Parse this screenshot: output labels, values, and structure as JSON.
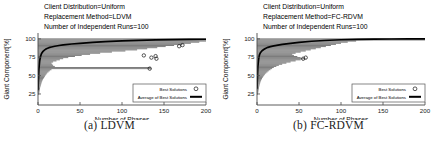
{
  "figure": {
    "panels": [
      {
        "caption": "(a) LDVM",
        "annotations": [
          "Client Distribution=Uniform",
          "Replacement Method=LDVM",
          "Number of Independent Runs=100"
        ],
        "legend": {
          "best_label": "Best Solutions",
          "avg_label": "Average of Best Solutions",
          "best_marker": "circle-marker",
          "avg_marker": "solid-line"
        },
        "chart_data": {
          "type": "scatter",
          "title": "",
          "xlabel": "Number of Phases",
          "ylabel": "Giant Component[%]",
          "xlim": [
            0,
            200
          ],
          "ylim": [
            10,
            108
          ],
          "xticks": [
            0,
            50,
            100,
            150,
            200
          ],
          "yticks": [
            25,
            50,
            75,
            100
          ],
          "grid": false,
          "series": [
            {
              "name": "Average of Best Solutions",
              "type": "line",
              "x": [
                0,
                1,
                2,
                3,
                4,
                5,
                6,
                8,
                10,
                13,
                16,
                20,
                25,
                30,
                40,
                50,
                65,
                80,
                100,
                120,
                140,
                160,
                180,
                200
              ],
              "y": [
                30,
                58,
                70,
                76,
                79.5,
                81.5,
                83,
                85,
                86.5,
                88,
                89,
                90,
                91,
                91.8,
                93,
                94,
                95.2,
                96.2,
                97.2,
                98,
                98.6,
                99,
                99.3,
                99.5
              ]
            },
            {
              "name": "Best Solutions spread",
              "type": "horizontal-bands",
              "comment": "each band = run max extent at a giant-component level; x_end is the phase where that level is reached",
              "bands": [
                {
                  "y": 25.0,
                  "x_start": 0.0,
                  "x_end": 1.4
                },
                {
                  "y": 26.5,
                  "x_start": 0.0,
                  "x_end": 1.6
                },
                {
                  "y": 28.0,
                  "x_start": 0.0,
                  "x_end": 1.8
                },
                {
                  "y": 29.5,
                  "x_start": 0.0,
                  "x_end": 2.0
                },
                {
                  "y": 31.0,
                  "x_start": 0.0,
                  "x_end": 2.2
                },
                {
                  "y": 32.5,
                  "x_start": 0.0,
                  "x_end": 2.4
                },
                {
                  "y": 34.0,
                  "x_start": 0.0,
                  "x_end": 2.6
                },
                {
                  "y": 35.5,
                  "x_start": 0.0,
                  "x_end": 3.0
                },
                {
                  "y": 37.0,
                  "x_start": 0.0,
                  "x_end": 3.4
                },
                {
                  "y": 38.5,
                  "x_start": 0.0,
                  "x_end": 3.8
                },
                {
                  "y": 40.0,
                  "x_start": 0.0,
                  "x_end": 4.2
                },
                {
                  "y": 41.5,
                  "x_start": 0.0,
                  "x_end": 4.6
                },
                {
                  "y": 43.0,
                  "x_start": 0.0,
                  "x_end": 5.2
                },
                {
                  "y": 44.5,
                  "x_start": 0.0,
                  "x_end": 5.8
                },
                {
                  "y": 46.0,
                  "x_start": 0.0,
                  "x_end": 6.6
                },
                {
                  "y": 47.5,
                  "x_start": 0.0,
                  "x_end": 7.4
                },
                {
                  "y": 49.0,
                  "x_start": 0.0,
                  "x_end": 8.2
                },
                {
                  "y": 50.5,
                  "x_start": 0.0,
                  "x_end": 9.0
                },
                {
                  "y": 52.0,
                  "x_start": 0.0,
                  "x_end": 10.0
                },
                {
                  "y": 53.5,
                  "x_start": 0.0,
                  "x_end": 11.0
                },
                {
                  "y": 55.0,
                  "x_start": 0.0,
                  "x_end": 12.5
                },
                {
                  "y": 56.5,
                  "x_start": 0.0,
                  "x_end": 14.0
                },
                {
                  "y": 58.0,
                  "x_start": 0.0,
                  "x_end": 16.0
                },
                {
                  "y": 59.5,
                  "x_start": 0.0,
                  "x_end": 135.0
                },
                {
                  "y": 61.0,
                  "x_start": 0.0,
                  "x_end": 134.0
                },
                {
                  "y": 62.5,
                  "x_start": 0.0,
                  "x_end": 20.0
                },
                {
                  "y": 64.0,
                  "x_start": 0.0,
                  "x_end": 18.0
                },
                {
                  "y": 65.5,
                  "x_start": 0.0,
                  "x_end": 17.0
                },
                {
                  "y": 67.0,
                  "x_start": 0.0,
                  "x_end": 16.0
                },
                {
                  "y": 68.5,
                  "x_start": 0.0,
                  "x_end": 18.0
                },
                {
                  "y": 70.0,
                  "x_start": 0.0,
                  "x_end": 22.0
                },
                {
                  "y": 71.5,
                  "x_start": 0.0,
                  "x_end": 26.0
                },
                {
                  "y": 73.0,
                  "x_start": 0.0,
                  "x_end": 30.0
                },
                {
                  "y": 74.5,
                  "x_start": 0.0,
                  "x_end": 36.0
                },
                {
                  "y": 76.0,
                  "x_start": 0.0,
                  "x_end": 44.0
                },
                {
                  "y": 77.5,
                  "x_start": 0.0,
                  "x_end": 52.0
                },
                {
                  "y": 79.0,
                  "x_start": 0.0,
                  "x_end": 62.0
                },
                {
                  "y": 80.5,
                  "x_start": 0.0,
                  "x_end": 74.0
                },
                {
                  "y": 82.0,
                  "x_start": 0.0,
                  "x_end": 88.0
                },
                {
                  "y": 83.5,
                  "x_start": 0.0,
                  "x_end": 104.0
                },
                {
                  "y": 85.0,
                  "x_start": 0.0,
                  "x_end": 118.0
                },
                {
                  "y": 86.5,
                  "x_start": 0.0,
                  "x_end": 130.0
                },
                {
                  "y": 88.0,
                  "x_start": 0.0,
                  "x_end": 142.0
                },
                {
                  "y": 89.5,
                  "x_start": 0.0,
                  "x_end": 152.0
                },
                {
                  "y": 91.0,
                  "x_start": 0.0,
                  "x_end": 162.0
                },
                {
                  "y": 92.5,
                  "x_start": 0.0,
                  "x_end": 172.0
                },
                {
                  "y": 94.0,
                  "x_start": 0.0,
                  "x_end": 182.0
                },
                {
                  "y": 95.5,
                  "x_start": 0.0,
                  "x_end": 192.0
                },
                {
                  "y": 97.0,
                  "x_start": 0.0,
                  "x_end": 200.0
                },
                {
                  "y": 98.5,
                  "x_start": 0.0,
                  "x_end": 200.0
                },
                {
                  "y": 100.0,
                  "x_start": 0.0,
                  "x_end": 200.0
                }
              ],
              "outliers": [
                {
                  "x": 126,
                  "y": 77.5
                },
                {
                  "x": 133,
                  "y": 59.5
                },
                {
                  "x": 135,
                  "y": 74.5
                },
                {
                  "x": 140,
                  "y": 76.5
                },
                {
                  "x": 141,
                  "y": 73.0
                },
                {
                  "x": 168,
                  "y": 90.0
                },
                {
                  "x": 172,
                  "y": 91.5
                }
              ]
            }
          ]
        }
      },
      {
        "caption": "(b) FC-RDVM",
        "annotations": [
          "Client Distribution=Uniform",
          "Replacement Method=FC-RDVM",
          "Number of Independent Runs=100"
        ],
        "legend": {
          "best_label": "Best Solutions",
          "avg_label": "Average of Best Solutions",
          "best_marker": "circle-marker",
          "avg_marker": "solid-line"
        },
        "chart_data": {
          "type": "scatter",
          "title": "",
          "xlabel": "Number of Phases",
          "ylabel": "Giant Component[%]",
          "xlim": [
            0,
            200
          ],
          "ylim": [
            10,
            108
          ],
          "xticks": [
            0,
            50,
            100,
            150,
            200
          ],
          "yticks": [
            25,
            50,
            75,
            100
          ],
          "grid": false,
          "series": [
            {
              "name": "Average of Best Solutions",
              "type": "line",
              "x": [
                0,
                1,
                2,
                3,
                4,
                5,
                6,
                8,
                10,
                13,
                16,
                20,
                25,
                30,
                40,
                50,
                65,
                80,
                100,
                120,
                140,
                160,
                180,
                200
              ],
              "y": [
                32,
                62,
                73,
                78.5,
                81,
                82.5,
                83.8,
                85.5,
                87,
                88.5,
                89.5,
                90.5,
                91.5,
                92.5,
                94,
                95.2,
                96.8,
                97.8,
                98.8,
                99.3,
                99.6,
                99.8,
                99.9,
                100
              ],
              "comment": "rises faster and saturates at 100 by ~x=120"
            },
            {
              "name": "Best Solutions spread",
              "type": "horizontal-bands",
              "bands": [
                {
                  "y": 25.0,
                  "x_start": 0.0,
                  "x_end": 1.2
                },
                {
                  "y": 26.5,
                  "x_start": 0.0,
                  "x_end": 1.4
                },
                {
                  "y": 28.0,
                  "x_start": 0.0,
                  "x_end": 1.6
                },
                {
                  "y": 29.5,
                  "x_start": 0.0,
                  "x_end": 1.8
                },
                {
                  "y": 31.0,
                  "x_start": 0.0,
                  "x_end": 2.0
                },
                {
                  "y": 32.5,
                  "x_start": 0.0,
                  "x_end": 2.2
                },
                {
                  "y": 34.0,
                  "x_start": 0.0,
                  "x_end": 2.4
                },
                {
                  "y": 35.5,
                  "x_start": 0.0,
                  "x_end": 2.7
                },
                {
                  "y": 37.0,
                  "x_start": 0.0,
                  "x_end": 3.0
                },
                {
                  "y": 38.5,
                  "x_start": 0.0,
                  "x_end": 3.4
                },
                {
                  "y": 40.0,
                  "x_start": 0.0,
                  "x_end": 3.8
                },
                {
                  "y": 41.5,
                  "x_start": 0.0,
                  "x_end": 4.2
                },
                {
                  "y": 43.0,
                  "x_start": 0.0,
                  "x_end": 4.8
                },
                {
                  "y": 44.5,
                  "x_start": 0.0,
                  "x_end": 5.4
                },
                {
                  "y": 46.0,
                  "x_start": 0.0,
                  "x_end": 6.0
                },
                {
                  "y": 47.5,
                  "x_start": 0.0,
                  "x_end": 6.8
                },
                {
                  "y": 49.0,
                  "x_start": 0.0,
                  "x_end": 7.6
                },
                {
                  "y": 50.5,
                  "x_start": 0.0,
                  "x_end": 8.6
                },
                {
                  "y": 52.0,
                  "x_start": 0.0,
                  "x_end": 9.6
                },
                {
                  "y": 53.5,
                  "x_start": 0.0,
                  "x_end": 11.0
                },
                {
                  "y": 55.0,
                  "x_start": 0.0,
                  "x_end": 12.5
                },
                {
                  "y": 56.5,
                  "x_start": 0.0,
                  "x_end": 14.0
                },
                {
                  "y": 58.0,
                  "x_start": 0.0,
                  "x_end": 16.0
                },
                {
                  "y": 59.5,
                  "x_start": 0.0,
                  "x_end": 18.0
                },
                {
                  "y": 61.0,
                  "x_start": 0.0,
                  "x_end": 20.0
                },
                {
                  "y": 62.5,
                  "x_start": 0.0,
                  "x_end": 23.0
                },
                {
                  "y": 64.0,
                  "x_start": 0.0,
                  "x_end": 26.0
                },
                {
                  "y": 65.5,
                  "x_start": 0.0,
                  "x_end": 30.0
                },
                {
                  "y": 67.0,
                  "x_start": 0.0,
                  "x_end": 35.0
                },
                {
                  "y": 68.5,
                  "x_start": 0.0,
                  "x_end": 40.0
                },
                {
                  "y": 70.0,
                  "x_start": 0.0,
                  "x_end": 46.0
                },
                {
                  "y": 71.5,
                  "x_start": 0.0,
                  "x_end": 52.0
                },
                {
                  "y": 73.0,
                  "x_start": 0.0,
                  "x_end": 57.0
                },
                {
                  "y": 74.5,
                  "x_start": 0.0,
                  "x_end": 52.0
                },
                {
                  "y": 76.0,
                  "x_start": 0.0,
                  "x_end": 48.0
                },
                {
                  "y": 77.5,
                  "x_start": 0.0,
                  "x_end": 44.0
                },
                {
                  "y": 79.0,
                  "x_start": 0.0,
                  "x_end": 42.0
                },
                {
                  "y": 80.5,
                  "x_start": 0.0,
                  "x_end": 46.0
                },
                {
                  "y": 82.0,
                  "x_start": 0.0,
                  "x_end": 52.0
                },
                {
                  "y": 83.5,
                  "x_start": 0.0,
                  "x_end": 58.0
                },
                {
                  "y": 85.0,
                  "x_start": 0.0,
                  "x_end": 64.0
                },
                {
                  "y": 86.5,
                  "x_start": 0.0,
                  "x_end": 70.0
                },
                {
                  "y": 88.0,
                  "x_start": 0.0,
                  "x_end": 76.0
                },
                {
                  "y": 89.5,
                  "x_start": 0.0,
                  "x_end": 82.0
                },
                {
                  "y": 91.0,
                  "x_start": 0.0,
                  "x_end": 88.0
                },
                {
                  "y": 92.5,
                  "x_start": 0.0,
                  "x_end": 94.0
                },
                {
                  "y": 94.0,
                  "x_start": 0.0,
                  "x_end": 100.0
                },
                {
                  "y": 95.5,
                  "x_start": 0.0,
                  "x_end": 108.0
                },
                {
                  "y": 97.0,
                  "x_start": 0.0,
                  "x_end": 118.0
                },
                {
                  "y": 98.5,
                  "x_start": 0.0,
                  "x_end": 200.0
                },
                {
                  "y": 100.0,
                  "x_start": 0.0,
                  "x_end": 200.0
                }
              ],
              "outliers": [
                {
                  "x": 55,
                  "y": 73.0
                },
                {
                  "x": 58,
                  "y": 74.5
                }
              ]
            }
          ]
        }
      }
    ]
  }
}
